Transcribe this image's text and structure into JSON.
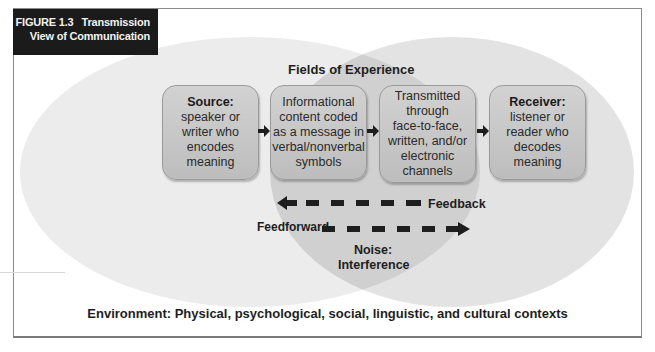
{
  "figure": {
    "number": "FIGURE 1.3",
    "title_line1": "Transmission",
    "title_line2": "View of Communication"
  },
  "fields_label": "Fields of Experience",
  "boxes": [
    {
      "head": "Source:",
      "lines": [
        "speaker or",
        "writer who",
        "encodes",
        "meaning"
      ]
    },
    {
      "head": "",
      "lines": [
        "Informational",
        "content coded",
        "as a message in",
        "verbal/nonverbal",
        "symbols"
      ]
    },
    {
      "head": "",
      "lines": [
        "Transmitted",
        "through",
        "face-to-face,",
        "written, and/or",
        "electronic",
        "channels"
      ]
    },
    {
      "head": "Receiver:",
      "lines": [
        "listener or",
        "reader who",
        "decodes",
        "meaning"
      ]
    }
  ],
  "feedback_label": "Feedback",
  "feedforward_label": "Feedforward",
  "noise_label_line1": "Noise:",
  "noise_label_line2": "Interference",
  "environment_label": "Environment: Physical, psychological, social, linguistic, and cultural contexts",
  "colors": {
    "title_bg": "#1b1b1b",
    "left_ellipse": "#e9e9e9",
    "right_ellipse": "#e2e2e2",
    "overlap": "#cfcfcf",
    "box_fill": "#c8c8c8",
    "arrow": "#1e1e1e"
  }
}
